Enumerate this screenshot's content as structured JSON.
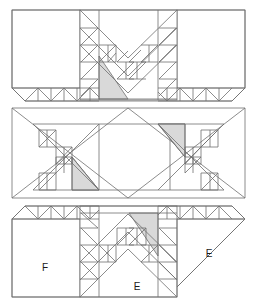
{
  "figure": {
    "background_color": "#ffffff",
    "line_color": "#6e6e6e",
    "shade_color": "#d9d9d9",
    "width": 257,
    "height": 304
  },
  "panels": [
    {
      "id": "panel-top",
      "name": "top-row-unit",
      "y": 8,
      "height": 95,
      "description": "Chevron / V sawtooth unit with flying-geese border strips",
      "labels": []
    },
    {
      "id": "panel-middle",
      "name": "middle-row-unit",
      "y": 108,
      "height": 90,
      "description": "Hourglass bowtie with two mirrored X sawtooth units",
      "labels": []
    },
    {
      "id": "panel-bottom",
      "name": "bottom-row-unit",
      "y": 206,
      "height": 96,
      "description": "Chevron unit with corner squares labelled F and E",
      "labels": [
        {
          "text": "F",
          "x": 45,
          "y": 268
        },
        {
          "text": "E",
          "x": 137,
          "y": 287
        },
        {
          "text": "E",
          "x": 209,
          "y": 254
        }
      ]
    }
  ],
  "legend_letters": [
    "F",
    "E",
    "E"
  ]
}
